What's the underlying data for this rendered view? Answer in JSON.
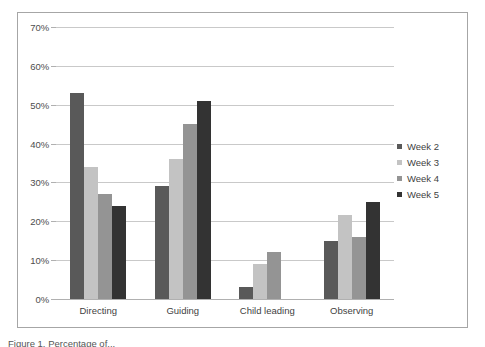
{
  "chart_data": {
    "type": "bar",
    "title": "",
    "subtitle": "",
    "xlabel": "",
    "ylabel": "",
    "categories": [
      "Directing",
      "Guiding",
      "Child leading",
      "Observing"
    ],
    "series": [
      {
        "name": "Week 2",
        "color": "#595959",
        "values": [
          53,
          29,
          3,
          15
        ]
      },
      {
        "name": "Week 3",
        "color": "#c3c3c3",
        "values": [
          34,
          36,
          9,
          21.5
        ]
      },
      {
        "name": "Week 4",
        "color": "#949494",
        "values": [
          27,
          45,
          12,
          16
        ]
      },
      {
        "name": "Week 5",
        "color": "#333333",
        "values": [
          24,
          51,
          0,
          25
        ]
      }
    ],
    "ylim": [
      0,
      70
    ],
    "ytick_values": [
      70,
      60,
      50,
      40,
      30,
      20,
      10,
      0
    ],
    "ytick_labels": [
      "70%",
      "60%",
      "50%",
      "40%",
      "30%",
      "20%",
      "10%",
      "0%"
    ],
    "grid": "horizontal",
    "legend_position": "right",
    "value_suffix": "%"
  },
  "caption": {
    "text": "Figure 1. Percentage of..."
  },
  "colors": {
    "frame_border": "#a6a6a6",
    "gridline": "#c9c9c9",
    "axis_line": "#b0b0b0",
    "text": "#3f3f3f",
    "background": "#ffffff"
  }
}
